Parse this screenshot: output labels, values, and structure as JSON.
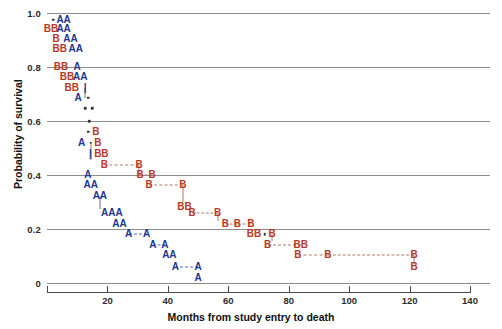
{
  "chart_data": {
    "type": "scatter",
    "title": "",
    "xlabel": "Months from study entry to death",
    "ylabel": "Probability of survival",
    "xlim": [
      0,
      140
    ],
    "ylim": [
      0,
      1.0
    ],
    "xticks": [
      0,
      20,
      40,
      60,
      80,
      100,
      120,
      140
    ],
    "xticklabels": [
      "",
      "20",
      "40",
      "60",
      "80",
      "100",
      "120",
      "140"
    ],
    "yticks": [
      0,
      0.2,
      0.4,
      0.6,
      0.8,
      1.0
    ],
    "yticklabels": [
      "0",
      "0.2",
      "0.4",
      "0.6",
      "0.8",
      "1.0"
    ],
    "grid": "horizontal",
    "legend": "none",
    "series": [
      {
        "name": "A",
        "color": "#23358f",
        "label": "A"
      },
      {
        "name": "B",
        "color": "#b63a27",
        "label": "B"
      }
    ],
    "rows": [
      {
        "y": 0.975,
        "items": [
          {
            "t": ".",
            "x": 2.0
          },
          {
            "t": "AA",
            "x": 5.5
          }
        ]
      },
      {
        "y": 0.94,
        "items": [
          {
            "t": "BB",
            "x": 1.3
          },
          {
            "t": "AA",
            "x": 5.5
          }
        ]
      },
      {
        "y": 0.905,
        "items": [
          {
            "t": "B",
            "x": 3.0
          },
          {
            "t": "AA",
            "x": 7.8
          }
        ]
      },
      {
        "y": 0.868,
        "items": [
          {
            "t": "BB",
            "x": 4.2
          },
          {
            "t": "AA",
            "x": 9.5
          }
        ]
      },
      {
        "y": 0.8,
        "items": [
          {
            "t": "BB",
            "x": 4.6
          },
          {
            "t": "A",
            "x": 10.0
          }
        ]
      },
      {
        "y": 0.762,
        "items": [
          {
            "t": "BB",
            "x": 6.6
          },
          {
            "t": "AA",
            "x": 11.0
          }
        ]
      },
      {
        "y": 0.724,
        "items": [
          {
            "t": "BB",
            "x": 8.2
          },
          {
            "t": "|",
            "x": 12.6
          }
        ]
      },
      {
        "y": 0.686,
        "items": [
          {
            "t": "A",
            "x": 10.3
          },
          {
            "t": ".",
            "x": 13.6
          }
        ]
      },
      {
        "y": 0.648,
        "items": [
          {
            "t": ".",
            "x": 12.6
          },
          {
            "t": ".",
            "x": 15.0
          }
        ]
      },
      {
        "y": 0.6,
        "items": [
          {
            "t": ".",
            "x": 14.0
          }
        ]
      },
      {
        "y": 0.56,
        "items": [
          {
            "t": ".",
            "x": 13.7
          },
          {
            "t": "B",
            "x": 16.2
          }
        ]
      },
      {
        "y": 0.52,
        "items": [
          {
            "t": "A",
            "x": 11.5
          },
          {
            "t": ".",
            "x": 14.4
          },
          {
            "t": "B",
            "x": 16.8
          }
        ]
      },
      {
        "y": 0.478,
        "items": [
          {
            "t": "|",
            "x": 14.4
          },
          {
            "t": "BB",
            "x": 18.0
          }
        ]
      },
      {
        "y": 0.437,
        "items": [
          {
            "t": "B",
            "x": 19.0
          },
          {
            "t": "B",
            "x": 30.5
          }
        ]
      },
      {
        "y": 0.4,
        "items": [
          {
            "t": "A",
            "x": 13.5
          },
          {
            "t": "B",
            "x": 30.8
          },
          {
            "t": "B",
            "x": 34.8
          }
        ]
      },
      {
        "y": 0.362,
        "items": [
          {
            "t": "AA",
            "x": 14.5
          },
          {
            "t": "B",
            "x": 33.8
          },
          {
            "t": "B",
            "x": 45.0
          }
        ]
      },
      {
        "y": 0.322,
        "items": [
          {
            "t": "AA",
            "x": 17.5
          }
        ]
      },
      {
        "y": 0.282,
        "items": [
          {
            "t": "BB",
            "x": 45.5
          }
        ]
      },
      {
        "y": 0.258,
        "items": [
          {
            "t": "AAA",
            "x": 21.5
          },
          {
            "t": "B",
            "x": 48.0
          },
          {
            "t": "B",
            "x": 56.5
          }
        ]
      },
      {
        "y": 0.218,
        "items": [
          {
            "t": "AA",
            "x": 24.0
          },
          {
            "t": "B",
            "x": 59.0
          },
          {
            "t": "B",
            "x": 63.0
          },
          {
            "t": "B",
            "x": 67.5
          }
        ]
      },
      {
        "y": 0.18,
        "items": [
          {
            "t": "A",
            "x": 27.0
          },
          {
            "t": "A",
            "x": 33.0
          },
          {
            "t": "BB",
            "x": 68.5
          },
          {
            "t": ".",
            "x": 72.0
          },
          {
            "t": "B",
            "x": 74.5
          }
        ]
      },
      {
        "y": 0.142,
        "items": [
          {
            "t": "A",
            "x": 35.0
          },
          {
            "t": "A",
            "x": 39.0
          },
          {
            "t": "B",
            "x": 73.0
          },
          {
            "t": "BB",
            "x": 84.0
          }
        ]
      },
      {
        "y": 0.104,
        "items": [
          {
            "t": "AA",
            "x": 40.5
          },
          {
            "t": "B",
            "x": 83.0
          },
          {
            "t": "B",
            "x": 93.0
          },
          {
            "t": "B",
            "x": 121.5
          }
        ]
      },
      {
        "y": 0.06,
        "items": [
          {
            "t": "A",
            "x": 42.5
          },
          {
            "t": "A",
            "x": 50.0
          },
          {
            "t": "B",
            "x": 121.5
          }
        ]
      },
      {
        "y": 0.02,
        "items": [
          {
            "t": "A",
            "x": 50.0
          }
        ]
      }
    ],
    "connectors_dashed": [
      {
        "y": 0.437,
        "x1": 19.0,
        "x2": 30.5,
        "series": "B"
      },
      {
        "y": 0.362,
        "x1": 33.8,
        "x2": 45.0,
        "series": "B"
      },
      {
        "y": 0.258,
        "x1": 48.0,
        "x2": 56.5,
        "series": "B"
      },
      {
        "y": 0.18,
        "x1": 27.0,
        "x2": 33.0,
        "series": "A"
      },
      {
        "y": 0.142,
        "x1": 73.0,
        "x2": 84.0,
        "series": "B"
      },
      {
        "y": 0.104,
        "x1": 83.0,
        "x2": 93.0,
        "series": "B"
      },
      {
        "y": 0.104,
        "x1": 93.0,
        "x2": 121.5,
        "series": "B"
      },
      {
        "y": 0.06,
        "x1": 42.5,
        "x2": 50.0,
        "series": "A"
      },
      {
        "y": 0.4,
        "x1": 30.8,
        "x2": 34.8,
        "series": "B"
      },
      {
        "y": 0.218,
        "x1": 59.0,
        "x2": 63.0,
        "series": "B"
      },
      {
        "y": 0.218,
        "x1": 63.0,
        "x2": 67.5,
        "series": "B"
      },
      {
        "y": 0.142,
        "x1": 35.0,
        "x2": 39.0,
        "series": "A"
      }
    ],
    "connectors_vertical": [
      {
        "x": 12.6,
        "y1": 0.724,
        "y2": 0.686,
        "series": "K"
      },
      {
        "x": 14.4,
        "y1": 0.52,
        "y2": 0.455,
        "series": "B"
      },
      {
        "x": 30.5,
        "y1": 0.437,
        "y2": 0.4,
        "series": "B"
      },
      {
        "x": 45.0,
        "y1": 0.362,
        "y2": 0.3,
        "series": "B"
      },
      {
        "x": 56.5,
        "y1": 0.258,
        "y2": 0.23,
        "series": "B"
      },
      {
        "x": 17.5,
        "y1": 0.322,
        "y2": 0.275,
        "series": "A"
      },
      {
        "x": 74.5,
        "y1": 0.18,
        "y2": 0.155,
        "series": "B"
      },
      {
        "x": 121.5,
        "y1": 0.104,
        "y2": 0.072,
        "series": "B"
      }
    ]
  }
}
